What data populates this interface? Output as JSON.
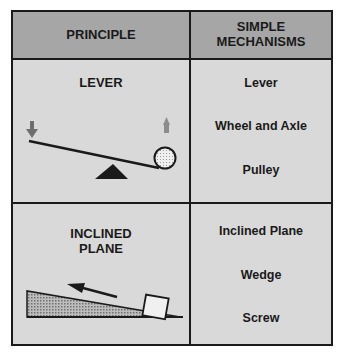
{
  "header": {
    "principle": "PRINCIPLE",
    "mechanisms_line1": "SIMPLE",
    "mechanisms_line2": "MECHANISMS"
  },
  "rows": [
    {
      "principle": "LEVER",
      "mechanisms": [
        "Lever",
        "Wheel and Axle",
        "Pulley"
      ],
      "illustration": "seesaw-lever-diagram"
    },
    {
      "principle_line1": "INCLINED",
      "principle_line2": "PLANE",
      "mechanisms": [
        "Inclined Plane",
        "Wedge",
        "Screw"
      ],
      "illustration": "inclined-plane-diagram"
    }
  ],
  "colors": {
    "header_bg": "#a6a6a6",
    "cell_bg": "#d9d9d9",
    "border": "#1a1a1a",
    "arrow_down": "#6e6e6e",
    "arrow_up": "#8c8c8c"
  }
}
